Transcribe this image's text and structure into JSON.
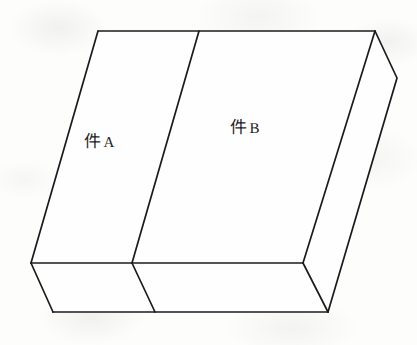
{
  "figure": {
    "background_color": "#fdfdfc",
    "line_color": "#1b1b1b",
    "face_color": "#fefefe",
    "labels": [
      {
        "id": "part-a",
        "cjk": "件",
        "latin": "A",
        "full": "件 A"
      },
      {
        "id": "part-b",
        "cjk": "件",
        "latin": "B",
        "full": "件 B"
      }
    ],
    "geometry": {
      "top_face_points": "98,31 375,31 303,263 31,263",
      "front_face_points": "31,263 303,263 328,312 53,312",
      "right_face_points": "375,31 397,78 328,312 303,263",
      "edge_top_back": "M 98,31 L 375,31",
      "edge_left": "M 98,31 L 31,263",
      "edge_front_top": "M 31,263 L 303,263",
      "edge_front_left": "M 31,263 L 53,312",
      "edge_bottom_front": "M 53,312 L 328,312",
      "edge_right_outer": "M 375,31 L 397,78 L 328,312",
      "edge_right_inner": "M 303,263 L 328,312",
      "edge_right_upper": "M 375,31 L 303,263",
      "divider_top_face": "M 199,31 L 132,263",
      "divider_front_face": "M 132,263 L 155,312"
    }
  }
}
